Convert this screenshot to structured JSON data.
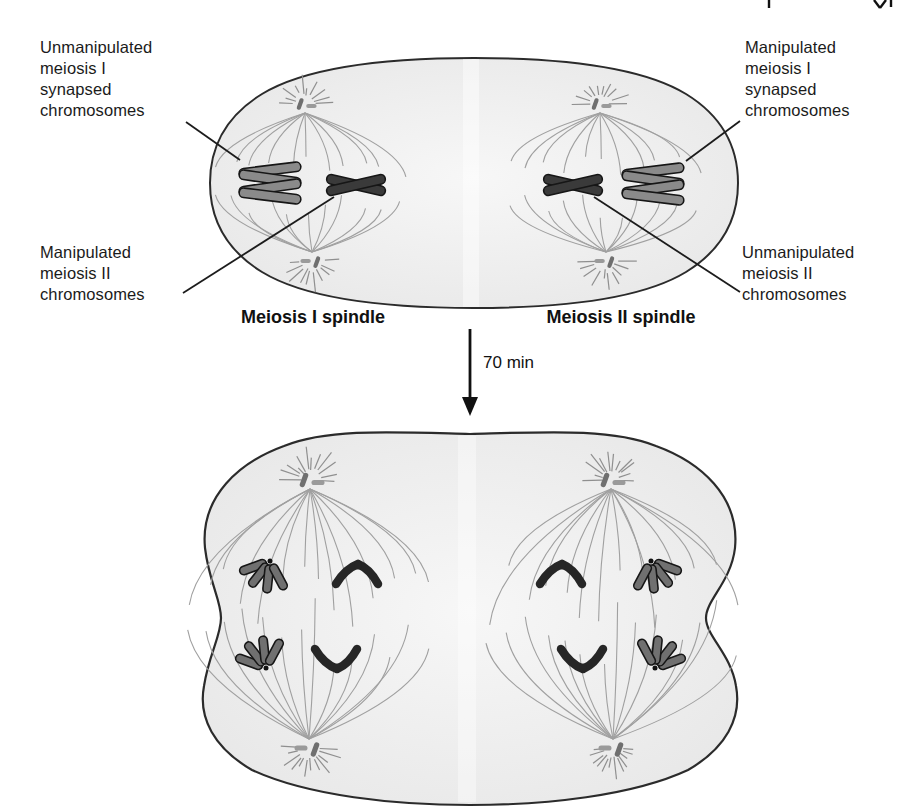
{
  "top_panel": {
    "label_unmanipulated_m1": "Unmanipulated\nmeiosis I\nsynapsed\nchromosomes",
    "label_manipulated_m1": "Manipulated\nmeiosis I\nsynapsed\nchromosomes",
    "label_manipulated_m2": "Manipulated\nmeiosis II\nchromosomes",
    "label_unmanipulated_m2": "Unmanipulated\nmeiosis II\nchromosomes",
    "caption_left_spindle": "Meiosis I spindle",
    "caption_right_spindle": "Meiosis II spindle"
  },
  "transition": {
    "duration_label": "70 min"
  },
  "colors": {
    "cell_fill": "#eeeeee",
    "cell_outline": "#2b2b2b",
    "spindle_fiber": "#a0a0a0",
    "chromosome_dark": "#3a3a3a",
    "chromosome_gray": "#8a8a8a",
    "anaphase_petal": "#707070",
    "centriole_dark": "#6f6f6f",
    "centriole_light": "#9a9a9a",
    "text": "#161616"
  }
}
